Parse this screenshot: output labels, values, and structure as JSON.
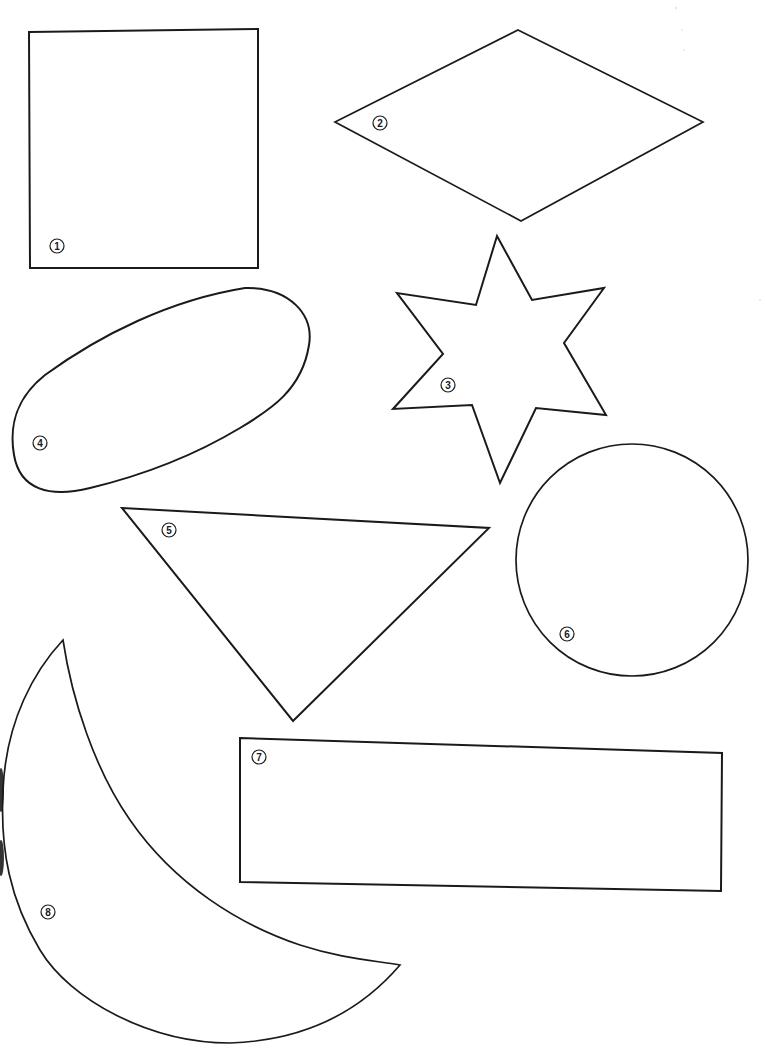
{
  "page": {
    "background": "#ffffff",
    "stroke_color": "#1a1a1a"
  },
  "shapes": [
    {
      "id": 1,
      "label": "1",
      "kind": "square",
      "points": "29,32 258,29 258,268 30,268",
      "label_pos": [
        57,
        246
      ]
    },
    {
      "id": 2,
      "label": "2",
      "kind": "rhombus",
      "points": "518,30 703,122 521,221 335,122",
      "label_pos": [
        380,
        123
      ]
    },
    {
      "id": 3,
      "label": "3",
      "kind": "six-pointed-star",
      "points": "497,236 532,300 604,288 564,343 606,415 536,408 500,483 472,405 393,409 443,354 397,293 476,305",
      "label_pos": [
        448,
        385
      ]
    },
    {
      "id": 4,
      "label": "4",
      "kind": "oval",
      "path": "M 245,288 C 290,287 314,315 309,345 C 302,390 270,410 240,428 C 190,458 140,476 90,488 C 50,498 20,490 14,455 C 8,420 20,395 45,375 C 100,335 170,300 245,288 Z",
      "label_pos": [
        40,
        443
      ]
    },
    {
      "id": 5,
      "label": "5",
      "kind": "triangle",
      "points": "122,508 489,528 293,721",
      "label_pos": [
        169,
        530
      ]
    },
    {
      "id": 6,
      "label": "6",
      "kind": "circle",
      "center": [
        632,
        560
      ],
      "radius": 116,
      "label_pos": [
        567,
        634
      ]
    },
    {
      "id": 7,
      "label": "7",
      "kind": "rectangle",
      "points": "240,738 722,753 721,891 240,882",
      "label_pos": [
        259,
        757
      ]
    },
    {
      "id": 8,
      "label": "8",
      "kind": "crescent",
      "path": "M 63,640 C 72,700 95,770 130,820 C 175,885 240,925 300,945 C 340,958 370,960 400,965 C 370,1000 320,1040 230,1043 C 150,1043 70,1000 40,950 C 10,900 0,850 3,790 C 6,720 35,670 63,640 Z",
      "label_pos": [
        48,
        912
      ]
    }
  ]
}
